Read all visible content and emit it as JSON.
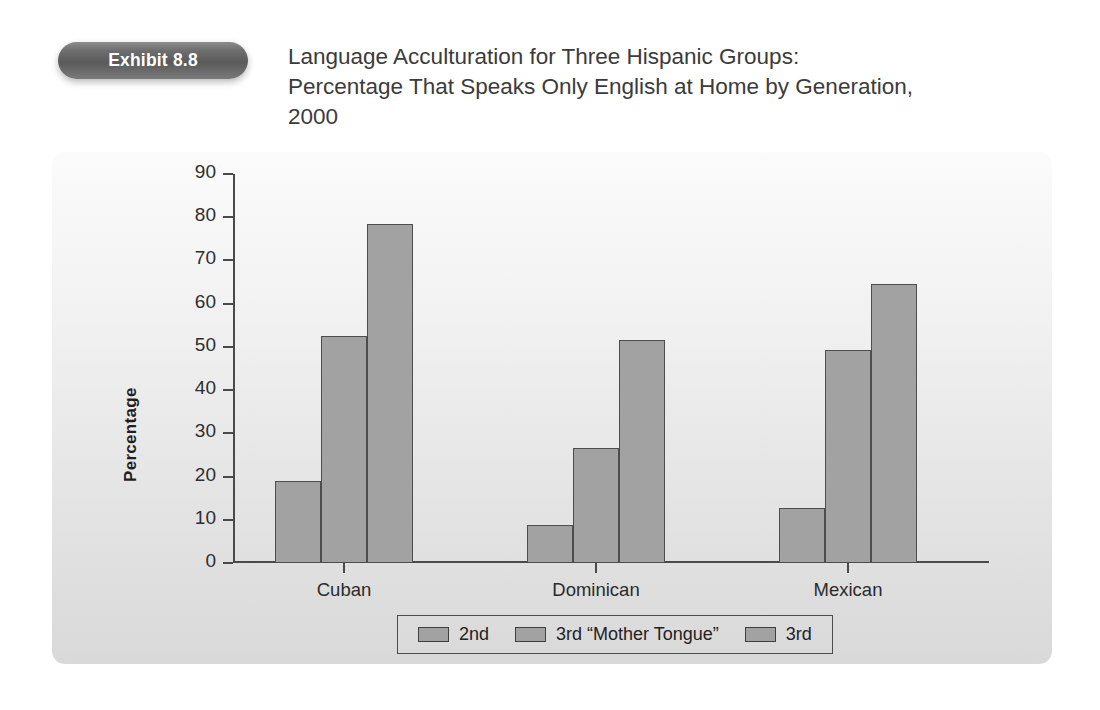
{
  "exhibit": {
    "badge_label": "Exhibit 8.8"
  },
  "title": "Language Acculturation for Three Hispanic Groups:\nPercentage That Speaks Only English at Home by Generation,\n2000",
  "colors": {
    "bar_fill": "#a2a2a2",
    "bar_border": "#4d4d4d",
    "axis": "#4a4a4a",
    "panel_top": "#fbfbfb",
    "panel_bottom": "#d9d9d9",
    "badge": "#5a5a5a",
    "title_text": "#3b3b3b"
  },
  "chart_data": {
    "type": "bar",
    "title": "Language Acculturation for Three Hispanic Groups: Percentage That Speaks Only English at Home by Generation, 2000",
    "xlabel": "",
    "ylabel": "Percentage",
    "categories": [
      "Cuban",
      "Dominican",
      "Mexican"
    ],
    "series": [
      {
        "name": "2nd",
        "values": [
          19.0,
          8.7,
          12.7
        ]
      },
      {
        "name": "3rd “Mother Tongue”",
        "values": [
          52.5,
          26.7,
          49.3
        ]
      },
      {
        "name": "3rd",
        "values": [
          78.5,
          51.7,
          64.5
        ]
      }
    ],
    "ylim": [
      0,
      90
    ],
    "yticks": [
      0,
      10,
      20,
      30,
      40,
      50,
      60,
      70,
      80,
      90
    ],
    "ytick_labels": [
      "0",
      "10",
      "20",
      "30",
      "40",
      "50",
      "60",
      "70",
      "80",
      "90"
    ],
    "grid": false,
    "legend_position": "bottom",
    "bar_gap_within_group": 0
  },
  "legend": {
    "items": [
      "2nd",
      "3rd “Mother Tongue”",
      "3rd"
    ]
  }
}
